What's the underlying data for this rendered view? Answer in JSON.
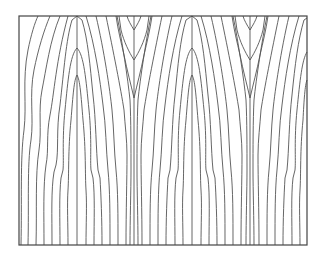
{
  "figure": {
    "frame": {
      "x": 19,
      "y": 16,
      "width": 288,
      "height": 229
    },
    "stroke_color": "#555555",
    "frame_color": "#444444",
    "background": "#ffffff",
    "finger_centers": [
      77,
      192
    ],
    "cusp_centers": [
      134,
      250
    ],
    "center_lines": [
      {
        "x": 77,
        "y1": 16,
        "y2": 245
      },
      {
        "x": 134,
        "y1": 16,
        "y2": 245
      },
      {
        "x": 192,
        "y1": 16,
        "y2": 245
      },
      {
        "x": 250,
        "y1": 16,
        "y2": 245
      }
    ],
    "contours": [
      "M21,245 C22,200 20,160 24,130 C27,105 22,80 28,50 C31,35 35,22 38,16",
      "M28,245 C29,205 27,165 31,140 C34,118 29,95 34,70 C38,50 44,30 50,16",
      "M36,245 C37,210 35,175 39,150 C42,130 38,110 42,90 C46,70 50,40 60,16",
      "M44,245 C44,215 43,185 46,165 C49,150 46,135 50,115 C54,95 56,60 68,16",
      "M52,245 C52,215 51,190 54,172 L56,165 C59,150 56,130 60,105 C64,70 66,40 72,20 L77,16",
      "M60,245 C60,220 59,195 61,178 L63,170 C64,160 62,140 65,110 C68,80 70,55 77,48 C84,55 86,80 89,110 C92,140 90,160 91,170 L93,178 C95,195 94,220 94,245",
      "M68,245 C68,225 67,205 68,190 C69,175 68,150 71,120 C73,95 74,80 77,75 C80,80 81,95 83,120 C86,150 85,175 86,190 C87,205 86,225 86,245",
      "M102,245 C102,220 101,195 100,178 L98,170 C96,150 96,120 93,95 C90,65 88,40 82,20 L77,16",
      "M110,245 C110,215 110,190 108,170 C106,150 106,125 103,105 C100,80 95,45 86,16",
      "M118,245 C118,215 118,190 116,170 C114,150 114,130 112,110 C110,90 104,50 96,16",
      "M126,245 C126,210 127,180 127,155 C127,140 125,125 124,110 C121,90 113,50 106,16",
      "M130,245 C130,220 131,190 131,170 C131,150 131,120 130,100 C128,80 122,40 117,16",
      "M134,98 C131,85 127,70 124,55 C121,42 118,30 116,16",
      "M134,98 C137,85 141,70 144,55 C147,42 150,30 152,16",
      "M134,60 C129,52 124,42 121,30 L119,16",
      "M134,60 C139,52 144,42 147,30 L149,16",
      "M134,30 C131,25 128,20 127,16",
      "M134,30 C137,25 140,20 141,16",
      "M138,245 C138,220 137,190 137,170 C137,150 137,120 138,100 C140,80 146,40 151,16",
      "M142,245 C142,210 141,180 141,155 C141,140 143,125 144,110 C147,90 155,50 162,16",
      "M150,245 C150,215 150,190 152,170 C154,150 154,130 156,110 C158,90 164,50 172,16",
      "M158,245 C158,215 158,190 160,170 C162,150 162,125 165,105 C168,80 173,45 182,16",
      "M166,245 C166,220 167,195 168,178 L170,170 C172,150 172,120 175,95 C178,65 180,40 186,20 L192,16",
      "M175,245 C175,220 174,195 176,178 L178,170 C179,160 177,140 180,110 C183,80 185,55 192,48 C199,55 201,80 204,110 C207,140 205,160 206,170 L208,178 C210,195 209,220 209,245",
      "M183,245 C183,225 182,205 183,190 C184,175 183,150 186,120 C188,95 189,80 192,75 C195,80 196,95 198,120 C201,150 200,175 201,190 C202,205 201,225 201,245",
      "M217,245 C217,220 216,195 215,178 L213,170 C211,150 211,120 208,95 C205,65 203,40 197,20 L192,16",
      "M225,245 C225,215 225,190 223,170 C221,150 221,125 218,105 C215,80 210,45 201,16",
      "M233,245 C233,215 233,190 231,170 C229,150 229,130 227,110 C225,90 219,50 211,16",
      "M241,245 C241,210 242,180 242,155 C242,140 240,125 239,110 C236,90 228,50 221,16",
      "M246,245 C246,220 247,190 247,170 C247,150 247,120 246,100 C244,80 238,40 233,16",
      "M250,98 C247,85 243,70 240,55 C237,42 234,30 232,16",
      "M250,98 C253,85 257,70 260,55 C263,42 266,30 268,16",
      "M250,60 C245,52 240,42 237,30 L235,16",
      "M250,60 C255,52 260,42 263,30 L265,16",
      "M250,30 C247,25 244,20 243,16",
      "M250,30 C253,25 256,20 257,16",
      "M254,245 C254,220 253,190 253,170 C253,150 253,120 254,100 C256,80 262,40 267,16",
      "M259,245 C259,210 258,180 258,155 C258,140 260,125 261,110 C264,90 272,50 279,16",
      "M267,245 C267,215 267,190 269,170 C271,150 271,130 273,110 C275,90 281,50 289,16",
      "M275,245 C275,215 275,190 277,170 C279,150 279,125 282,105 C285,80 290,45 299,16",
      "M283,245 C283,220 284,195 285,178 L287,170 C289,150 289,120 292,95 C295,65 298,40 304,20 L307,18",
      "M292,245 C292,220 291,195 293,178 L295,170 C296,160 294,140 297,110 C300,80 302,60 307,52",
      "M300,245 C300,225 299,205 300,190 C301,175 300,150 303,120 C304,100 305,85 307,80"
    ]
  }
}
